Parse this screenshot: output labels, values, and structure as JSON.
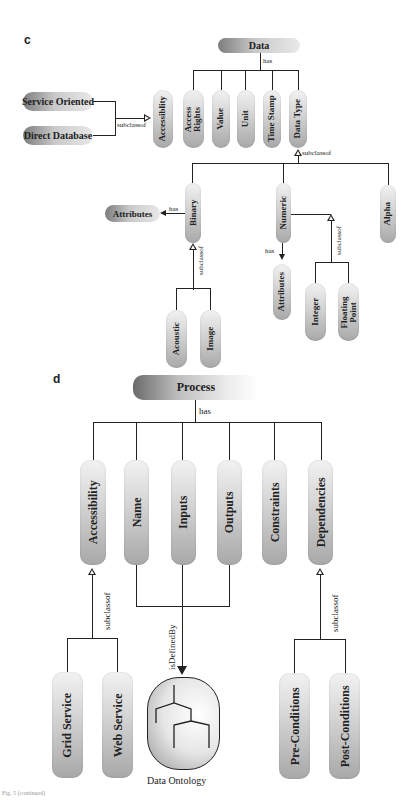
{
  "panel_c": {
    "label": "c",
    "root": "Data",
    "root_edge": "has",
    "properties": [
      "Accessiblity",
      "Access Rights",
      "Value",
      "Unit",
      "Time Stamp",
      "Data Type"
    ],
    "accessibility_subclasses": [
      "Service Oriented",
      "Direct Database"
    ],
    "accessibility_edge": "subclassof",
    "data_type_edge": "subclassof",
    "data_types": [
      "Binary",
      "Numeric",
      "Alpha"
    ],
    "binary": {
      "has_edge": "has",
      "has_target": "Attributes",
      "subclass_edge": "subclassof",
      "subclasses": [
        "Acoustic",
        "Image"
      ]
    },
    "numeric": {
      "has_edge": "has",
      "has_target": "Attributes",
      "subclass_edge": "subclassof",
      "subclasses": [
        "Integer",
        "Floating Point"
      ]
    }
  },
  "panel_d": {
    "label": "d",
    "root": "Process",
    "root_edge": "has",
    "properties": [
      "Accessibility",
      "Name",
      "Inputs",
      "Outputs",
      "Constraints",
      "Dependencies"
    ],
    "accessibility": {
      "edge": "subclassof",
      "subclasses": [
        "Grid Service",
        "Web Service"
      ]
    },
    "io": {
      "edge": "isDefinedBy",
      "target": "Data Ontology"
    },
    "dependencies": {
      "edge": "subclassof",
      "subclasses": [
        "Pre-Conditions",
        "Post-Conditions"
      ]
    }
  },
  "footer": {
    "caption": "Fig. 5 (continued)"
  }
}
